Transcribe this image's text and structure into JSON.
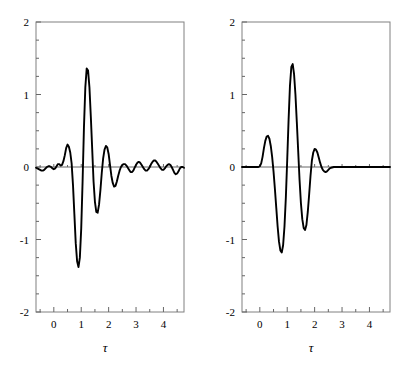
{
  "figure": {
    "background": "#ffffff",
    "curve_color": "#000000",
    "frame_color": "#808080",
    "axis_color": "#666666"
  },
  "chart_data": [
    {
      "type": "line",
      "panel": "left",
      "title": "",
      "xlabel": "τ",
      "ylabel": "",
      "xlim": [
        -0.65,
        4.75
      ],
      "ylim": [
        -2,
        2
      ],
      "xticks": [
        0,
        1,
        2,
        3,
        4
      ],
      "xtick_labels": [
        "0",
        "1",
        "2",
        "3",
        "4"
      ],
      "xminor_ticks": [
        -0.5,
        0.5,
        1.5,
        2.5,
        3.5,
        4.5
      ],
      "yticks": [
        -2,
        -1,
        0,
        1,
        2
      ],
      "ytick_labels": [
        "-2",
        "-1",
        "0",
        "1",
        "2"
      ],
      "yminor_ticks": [
        -1.75,
        -1.5,
        -1.25,
        -0.75,
        -0.5,
        -0.25,
        0.25,
        0.5,
        0.75,
        1.25,
        1.5,
        1.75
      ],
      "grid": false,
      "legend": "none",
      "x": [
        -0.65,
        -0.6,
        -0.55,
        -0.5,
        -0.45,
        -0.4,
        -0.35,
        -0.3,
        -0.25,
        -0.2,
        -0.15,
        -0.1,
        -0.05,
        0.0,
        0.05,
        0.1,
        0.15,
        0.2,
        0.25,
        0.3,
        0.35,
        0.4,
        0.45,
        0.5,
        0.55,
        0.6,
        0.65,
        0.7,
        0.75,
        0.8,
        0.85,
        0.9,
        0.95,
        1.0,
        1.05,
        1.1,
        1.15,
        1.2,
        1.25,
        1.3,
        1.35,
        1.4,
        1.45,
        1.5,
        1.55,
        1.6,
        1.65,
        1.7,
        1.75,
        1.8,
        1.85,
        1.9,
        1.95,
        2.0,
        2.05,
        2.1,
        2.15,
        2.2,
        2.25,
        2.3,
        2.35,
        2.4,
        2.45,
        2.5,
        2.55,
        2.6,
        2.65,
        2.7,
        2.75,
        2.8,
        2.85,
        2.9,
        2.95,
        3.0,
        3.05,
        3.1,
        3.15,
        3.2,
        3.25,
        3.3,
        3.35,
        3.4,
        3.45,
        3.5,
        3.55,
        3.6,
        3.65,
        3.7,
        3.75,
        3.8,
        3.85,
        3.9,
        3.95,
        4.0,
        4.05,
        4.1,
        4.15,
        4.2,
        4.25,
        4.3,
        4.35,
        4.4,
        4.45,
        4.5,
        4.55,
        4.6,
        4.65,
        4.7,
        4.75
      ],
      "y": [
        -0.01,
        -0.02,
        -0.03,
        -0.04,
        -0.05,
        -0.05,
        -0.04,
        -0.02,
        0.0,
        0.01,
        0.01,
        0.0,
        -0.02,
        -0.03,
        -0.02,
        0.01,
        0.04,
        0.04,
        0.02,
        0.03,
        0.08,
        0.16,
        0.26,
        0.31,
        0.28,
        0.2,
        0.05,
        -0.25,
        -0.65,
        -1.05,
        -1.3,
        -1.38,
        -1.25,
        -0.85,
        -0.2,
        0.55,
        1.1,
        1.36,
        1.33,
        1.1,
        0.7,
        0.25,
        -0.2,
        -0.48,
        -0.62,
        -0.63,
        -0.52,
        -0.32,
        -0.08,
        0.12,
        0.24,
        0.29,
        0.27,
        0.18,
        0.03,
        -0.12,
        -0.22,
        -0.27,
        -0.26,
        -0.2,
        -0.12,
        -0.05,
        0.0,
        0.03,
        0.04,
        0.04,
        0.02,
        -0.01,
        -0.04,
        -0.07,
        -0.07,
        -0.05,
        -0.01,
        0.03,
        0.06,
        0.07,
        0.06,
        0.03,
        0.0,
        -0.03,
        -0.05,
        -0.05,
        -0.03,
        0.0,
        0.04,
        0.07,
        0.09,
        0.09,
        0.07,
        0.04,
        0.01,
        -0.02,
        -0.04,
        -0.04,
        -0.02,
        0.01,
        0.03,
        0.04,
        0.03,
        0.0,
        -0.04,
        -0.08,
        -0.1,
        -0.09,
        -0.06,
        -0.02,
        0.0,
        0.0,
        -0.01
      ]
    },
    {
      "type": "line",
      "panel": "right",
      "title": "",
      "xlabel": "τ",
      "ylabel": "",
      "xlim": [
        -0.65,
        4.75
      ],
      "ylim": [
        -2,
        2
      ],
      "xticks": [
        0,
        1,
        2,
        3,
        4
      ],
      "xtick_labels": [
        "0",
        "1",
        "2",
        "3",
        "4"
      ],
      "xminor_ticks": [
        -0.5,
        0.5,
        1.5,
        2.5,
        3.5,
        4.5
      ],
      "yticks": [
        -2,
        -1,
        0,
        1,
        2
      ],
      "ytick_labels": [
        "-2",
        "-1",
        "0",
        "1",
        "2"
      ],
      "yminor_ticks": [
        -1.75,
        -1.5,
        -1.25,
        -0.75,
        -0.5,
        -0.25,
        0.25,
        0.5,
        0.75,
        1.25,
        1.5,
        1.75
      ],
      "grid": false,
      "legend": "none",
      "x": [
        -0.65,
        -0.55,
        -0.45,
        -0.35,
        -0.25,
        -0.15,
        -0.05,
        0.0,
        0.05,
        0.1,
        0.15,
        0.2,
        0.25,
        0.3,
        0.35,
        0.4,
        0.45,
        0.5,
        0.55,
        0.6,
        0.65,
        0.7,
        0.75,
        0.8,
        0.85,
        0.9,
        0.95,
        1.0,
        1.05,
        1.1,
        1.15,
        1.2,
        1.25,
        1.3,
        1.35,
        1.4,
        1.45,
        1.5,
        1.55,
        1.6,
        1.65,
        1.7,
        1.75,
        1.8,
        1.85,
        1.9,
        1.95,
        2.0,
        2.05,
        2.1,
        2.15,
        2.2,
        2.25,
        2.3,
        2.35,
        2.4,
        2.45,
        2.5,
        2.55,
        2.6,
        2.7,
        2.8,
        2.9,
        3.0,
        3.2,
        3.4,
        3.6,
        3.8,
        4.0,
        4.2,
        4.4,
        4.6,
        4.75
      ],
      "y": [
        0.0,
        0.0,
        0.0,
        0.0,
        0.0,
        0.0,
        0.0,
        0.01,
        0.05,
        0.14,
        0.26,
        0.36,
        0.42,
        0.43,
        0.39,
        0.29,
        0.14,
        -0.06,
        -0.3,
        -0.56,
        -0.82,
        -1.03,
        -1.15,
        -1.18,
        -1.08,
        -0.82,
        -0.42,
        0.1,
        0.65,
        1.12,
        1.38,
        1.42,
        1.28,
        1.0,
        0.62,
        0.22,
        -0.18,
        -0.5,
        -0.72,
        -0.84,
        -0.87,
        -0.8,
        -0.62,
        -0.38,
        -0.12,
        0.09,
        0.2,
        0.25,
        0.24,
        0.2,
        0.13,
        0.06,
        0.0,
        -0.04,
        -0.06,
        -0.07,
        -0.06,
        -0.04,
        -0.02,
        -0.01,
        0.0,
        0.0,
        0.0,
        0.0,
        0.0,
        0.0,
        0.0,
        0.0,
        0.0,
        0.0,
        0.0,
        0.0,
        0.0
      ]
    }
  ]
}
